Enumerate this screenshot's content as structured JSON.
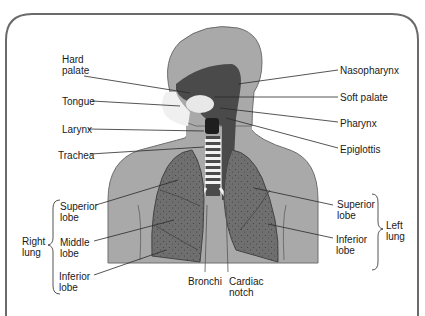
{
  "figure": {
    "colors": {
      "frame": "#6b6b6b",
      "body": "#a9a9a9",
      "body_outline": "#6e6e6e",
      "airway_dark": "#4a4a4a",
      "lung": "#6f6f6f",
      "lung_speckle": "#3f3f3f",
      "trachea_rings": "#f2f2f2",
      "leader_line": "#2a2a2a",
      "text": "#1a1a1a"
    },
    "labels": {
      "hard_palate": "Hard\npalate",
      "tongue": "Tongue",
      "larynx": "Larynx",
      "trachea": "Trachea",
      "nasopharynx": "Nasopharynx",
      "soft_palate": "Soft palate",
      "pharynx": "Pharynx",
      "epiglottis": "Epiglottis",
      "right_superior_lobe": "Superior\nlobe",
      "right_middle_lobe": "Middle\nlobe",
      "right_inferior_lobe": "Inferior\nlobe",
      "right_lung": "Right\nlung",
      "left_superior_lobe": "Superior\nlobe",
      "left_inferior_lobe": "Inferior\nlobe",
      "left_lung": "Left\nlung",
      "bronchi": "Bronchi",
      "cardiac_notch": "Cardiac\nnotch"
    }
  }
}
